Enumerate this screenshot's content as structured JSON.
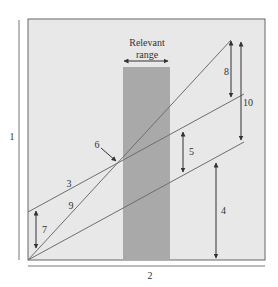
{
  "diagram": {
    "axis_labels": {
      "y": "1",
      "x": "2"
    },
    "relevant_range": {
      "line1": "Relevant",
      "line2": "range"
    },
    "labels": {
      "line_3": "3",
      "arrow_4": "4",
      "arrow_5": "5",
      "point_6": "6",
      "arrow_7": "7",
      "arrow_8": "8",
      "line_9": "9",
      "arrow_10": "10"
    },
    "colors": {
      "plot_bg": "#e8e8e8",
      "range_bar": "#a9a9a9",
      "lines": "#6e6e6e",
      "arrows": "#333333",
      "border": "#555555"
    }
  }
}
